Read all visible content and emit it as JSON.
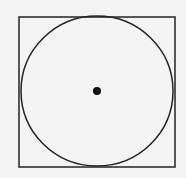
{
  "diagram": {
    "background": "#f4f4f4",
    "stroke_color": "#222222",
    "square": {
      "x": 19,
      "y": 17,
      "width": 156,
      "height": 150
    },
    "circle": {
      "cx": 97,
      "cy": 91,
      "rx": 76,
      "ry": 75
    },
    "center_dot": {
      "cx": 97,
      "cy": 91,
      "r": 4
    }
  }
}
